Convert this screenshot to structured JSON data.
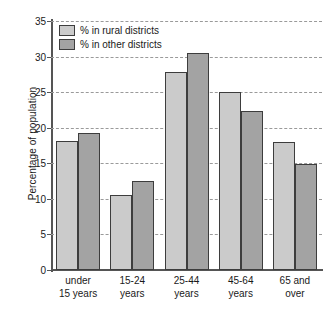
{
  "chart_data": {
    "type": "bar",
    "title": "",
    "subtitle": "",
    "xlabel": "",
    "ylabel": "Percentage of population",
    "ylim": [
      0,
      35
    ],
    "ytick_step": 5,
    "yticks": [
      0,
      5,
      10,
      15,
      20,
      25,
      30,
      35
    ],
    "ytick_labels": [
      "0",
      "5",
      "10",
      "15",
      "20",
      "25",
      "30",
      "35"
    ],
    "grid": true,
    "grid_style": "dashed-horizontal",
    "legend_position": "top-left-inside",
    "categories": [
      "under 15 years",
      "15-24 years",
      "25-44 years",
      "45-64 years",
      "65 and over"
    ],
    "category_lines": [
      [
        "under",
        "15 years"
      ],
      [
        "15-24",
        "years"
      ],
      [
        "25-44",
        "years"
      ],
      [
        "45-64",
        "years"
      ],
      [
        "65 and",
        "over"
      ]
    ],
    "series": [
      {
        "name": "% in rural districts",
        "color": "#cbcbcb",
        "values": [
          18.1,
          10.5,
          27.8,
          25.0,
          18.0
        ]
      },
      {
        "name": "% in other districts",
        "color": "#a3a3a3",
        "values": [
          19.2,
          12.5,
          30.5,
          22.3,
          14.9
        ]
      }
    ]
  },
  "legend": {
    "items": [
      {
        "label": "% in rural districts",
        "swatch": "rural"
      },
      {
        "label": "% in other districts",
        "swatch": "other"
      }
    ]
  },
  "colors": {
    "series_rural": "#cbcbcb",
    "series_other": "#a3a3a3",
    "bar_outline": "#3d3d3d",
    "axis": "#555555",
    "gridline": "#9a9a9a",
    "text": "#1a1a1a",
    "background": "#ffffff"
  }
}
